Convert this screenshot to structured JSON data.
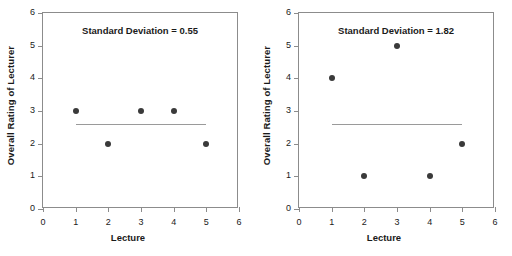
{
  "figure": {
    "background": "#ffffff",
    "marker_color": "#3a3a3a",
    "meanline_color": "#9a9a9a",
    "axis_color": "#8c8c8c"
  },
  "panels": [
    {
      "id": "left-panel",
      "annotation": "Standard Deviation = 0.55",
      "xlabel": "Lecture",
      "ylabel": "Overall Rating of Lecturer",
      "xticks": [
        "0",
        "1",
        "2",
        "3",
        "4",
        "5",
        "6"
      ],
      "yticks": [
        "0",
        "1",
        "2",
        "3",
        "4",
        "5",
        "6"
      ]
    },
    {
      "id": "right-panel",
      "annotation": "Standard Deviation = 1.82",
      "xlabel": "Lecture",
      "ylabel": "Overall Rating of Lecturer",
      "xticks": [
        "0",
        "1",
        "2",
        "3",
        "4",
        "5",
        "6"
      ],
      "yticks": [
        "0",
        "1",
        "2",
        "3",
        "4",
        "5",
        "6"
      ]
    }
  ],
  "chart_data": [
    {
      "type": "scatter",
      "title": "Standard Deviation = 0.55",
      "xlabel": "Lecture",
      "ylabel": "Overall Rating of Lecturer",
      "xlim": [
        0,
        6
      ],
      "ylim": [
        0,
        6
      ],
      "xticks": [
        0,
        1,
        2,
        3,
        4,
        5,
        6
      ],
      "yticks": [
        0,
        1,
        2,
        3,
        4,
        5,
        6
      ],
      "grid": false,
      "legend": "none",
      "x": [
        1,
        2,
        3,
        4,
        5
      ],
      "y": [
        3,
        2,
        3,
        3,
        2
      ],
      "annotations": [
        {
          "text": "Standard Deviation = 0.55",
          "x": 3.0,
          "y": 5.45
        }
      ],
      "reference_line": {
        "label": "mean",
        "value": 2.6,
        "x_start": 1,
        "x_end": 5,
        "orientation": "horizontal"
      }
    },
    {
      "type": "scatter",
      "title": "Standard Deviation = 1.82",
      "xlabel": "Lecture",
      "ylabel": "Overall Rating of Lecturer",
      "xlim": [
        0,
        6
      ],
      "ylim": [
        0,
        6
      ],
      "xticks": [
        0,
        1,
        2,
        3,
        4,
        5,
        6
      ],
      "yticks": [
        0,
        1,
        2,
        3,
        4,
        5,
        6
      ],
      "grid": false,
      "legend": "none",
      "x": [
        1,
        2,
        3,
        4,
        5
      ],
      "y": [
        4,
        1,
        5,
        1,
        2
      ],
      "annotations": [
        {
          "text": "Standard Deviation = 1.82",
          "x": 3.0,
          "y": 5.45
        }
      ],
      "reference_line": {
        "label": "mean",
        "value": 2.6,
        "x_start": 1,
        "x_end": 5,
        "orientation": "horizontal"
      }
    }
  ]
}
